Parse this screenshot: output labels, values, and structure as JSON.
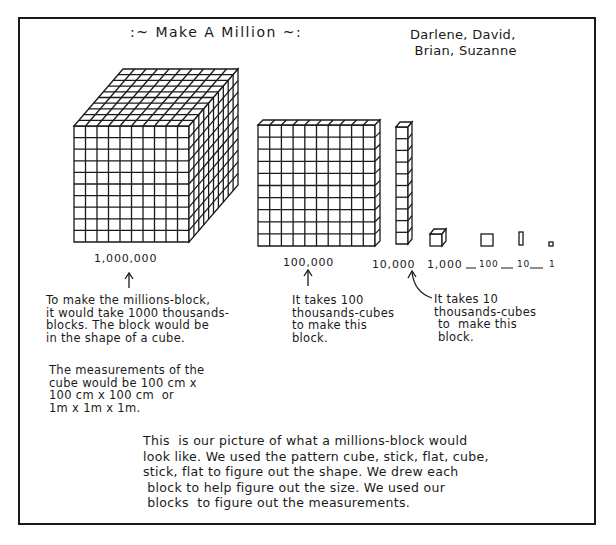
{
  "header": {
    "title": ":~ Make A Million ~:",
    "authors": "Darlene, David,\n Brian, Suzanne"
  },
  "blocks": [
    {
      "name": "millions-block",
      "label": "1,000,000"
    },
    {
      "name": "hundred-thousands-block",
      "label": "100,000"
    },
    {
      "name": "ten-thousands-block",
      "label": "10,000"
    },
    {
      "name": "thousands-cube",
      "label": "1,000"
    },
    {
      "name": "hundreds-flat",
      "label": "100"
    },
    {
      "name": "tens-stick",
      "label": "10"
    },
    {
      "name": "ones-unit",
      "label": "1"
    }
  ],
  "notes": {
    "million": "To make the millions-block,\nit would take 1000 thousands-\nblocks. The block would be\nin the shape of a cube.",
    "measurements": "The measurements of the\ncube would be 100 cm x\n100 cm x 100 cm  or\n1m x 1m x 1m.",
    "hundred_thousand": "It takes 100\nthousands-cubes\nto make this\nblock.",
    "ten_thousand": "It takes 10\nthousands-cubes\n to  make this\n block."
  },
  "colors": {
    "ink": "#1a1a1a",
    "paper": "#ffffff"
  }
}
